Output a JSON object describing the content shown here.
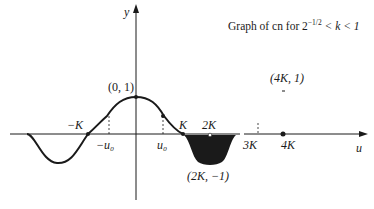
{
  "title": {
    "prefix": "Graph of cn for 2",
    "exponent": "−1/2",
    "suffix": " < k < 1"
  },
  "axes": {
    "y_label": "y",
    "x_label": "u"
  },
  "labels": {
    "peak": "(0, 1)",
    "neg_K": "−K",
    "neg_u0": "−u₀",
    "u0": "u₀",
    "K": "K",
    "twoK": "2K",
    "threeK": "3K",
    "fourK": "4K",
    "trough": "(2K, −1)",
    "fourK_point": "(4K, 1)"
  },
  "colors": {
    "ink": "#1a1a1a",
    "background": "#ffffff"
  }
}
